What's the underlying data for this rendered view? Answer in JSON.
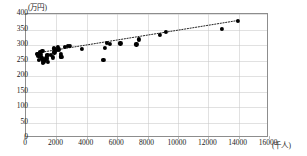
{
  "chart_data": {
    "type": "scatter",
    "title": "",
    "xlabel": "千人",
    "ylabel": "万円",
    "y_unit_label": "(万円)",
    "x_unit_label": "(千人)",
    "xlim": [
      0,
      16000
    ],
    "ylim": [
      0,
      400
    ],
    "xticks": [
      0,
      2000,
      4000,
      6000,
      8000,
      10000,
      12000,
      14000,
      16000
    ],
    "yticks": [
      0,
      50,
      100,
      150,
      200,
      250,
      300,
      350,
      400
    ],
    "grid": true,
    "legend": "none",
    "marker_color": "#000000",
    "grid_color": "#c9c9c9",
    "axis_color": "#8d8d8d",
    "series": [
      {
        "name": "prefectures",
        "marker": "filled-circle",
        "points": [
          [
            1308,
            259
          ],
          [
            1248,
            251
          ],
          [
            1123,
            248
          ],
          [
            2334,
            262
          ],
          [
            972,
            271
          ],
          [
            1080,
            281
          ],
          [
            1868,
            276
          ],
          [
            2917,
            296
          ],
          [
            2178,
            286
          ],
          [
            7267,
            302
          ],
          [
            6216,
            305
          ],
          [
            12900,
            353
          ],
          [
            9209,
            341
          ],
          [
            2303,
            272
          ],
          [
            1054,
            258
          ],
          [
            1163,
            247
          ],
          [
            2290,
            263
          ],
          [
            1862,
            289
          ],
          [
            2075,
            293
          ],
          [
            2751,
            297
          ],
          [
            7409,
            318
          ],
          [
            13942,
            378
          ],
          [
            8843,
            332
          ],
          [
            5203,
            291
          ],
          [
            1410,
            268
          ],
          [
            1067,
            255
          ],
          [
            816,
            264
          ],
          [
            1066,
            259
          ],
          [
            2044,
            283
          ],
          [
            3684,
            288
          ],
          [
            5322,
            306
          ],
          [
            2588,
            294
          ],
          [
            924,
            277
          ],
          [
            1403,
            265
          ],
          [
            1927,
            286
          ],
          [
            5101,
            251
          ],
          [
            1382,
            258
          ],
          [
            747,
            270
          ],
          [
            1005,
            263
          ],
          [
            5534,
            304
          ],
          [
            826,
            252
          ],
          [
            1392,
            256
          ],
          [
            1774,
            260
          ],
          [
            1166,
            249
          ],
          [
            1104,
            243
          ],
          [
            1626,
            267
          ],
          [
            1429,
            245
          ]
        ]
      }
    ],
    "trendline": {
      "style": "dotted",
      "x0": 700,
      "y0": 272,
      "x1": 14100,
      "y1": 379
    }
  }
}
